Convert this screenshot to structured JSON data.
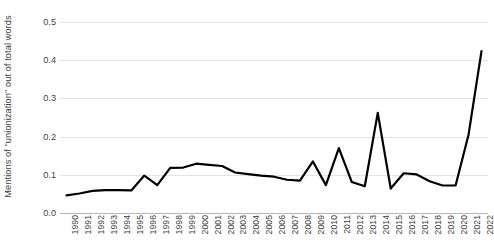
{
  "chart_data": {
    "type": "line",
    "title": "",
    "subtitle": "",
    "xlabel": "",
    "ylabel": "Mentions of \"unionization\" out of total words",
    "ylim": [
      0.0,
      0.5
    ],
    "ytick_labels": [
      "0.0",
      "0.1",
      "0.2",
      "0.3",
      "0.4",
      "0.5"
    ],
    "ytick_values": [
      0.0,
      0.1,
      0.2,
      0.3,
      0.4,
      0.5
    ],
    "grid": "horizontal",
    "legend": "none",
    "line_color": "#000000",
    "line_width": 2.2,
    "grid_color": "#e4e4e4",
    "axis_color": "#b6b6b6",
    "categories": [
      "1990",
      "1991",
      "1992",
      "1993",
      "1994",
      "1995",
      "1996",
      "1997",
      "1998",
      "1999",
      "2000",
      "2001",
      "2002",
      "2003",
      "2004",
      "2005",
      "2006",
      "2007",
      "2008",
      "2009",
      "2010",
      "2011",
      "2012",
      "2013",
      "2014",
      "2015",
      "2016",
      "2017",
      "2018",
      "2019",
      "2020",
      "2021",
      "2022"
    ],
    "series": [
      {
        "name": "Mentions of \"unionization\"",
        "values": [
          0.046,
          0.051,
          0.058,
          0.06,
          0.06,
          0.059,
          0.098,
          0.073,
          0.118,
          0.119,
          0.129,
          0.126,
          0.123,
          0.106,
          0.102,
          0.098,
          0.095,
          0.087,
          0.085,
          0.135,
          0.073,
          0.17,
          0.081,
          0.07,
          0.262,
          0.064,
          0.104,
          0.101,
          0.083,
          0.072,
          0.072,
          0.205,
          0.424
        ]
      }
    ]
  }
}
